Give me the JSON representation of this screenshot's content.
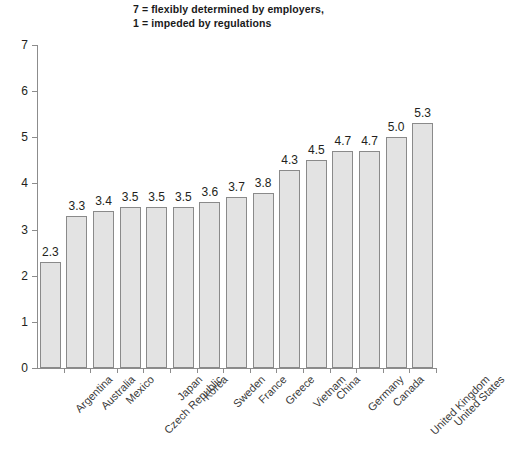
{
  "title": {
    "line1": "7 = flexibly determined by employers,",
    "line2": "1 = impeded by regulations"
  },
  "axis": {
    "y_ticks": [
      "0",
      "1",
      "2",
      "3",
      "4",
      "5",
      "6",
      "7"
    ]
  },
  "colors": {
    "bar_fill": "#e3e3e3",
    "bar_stroke": "#8a8a8a",
    "axis": "#8c8c8c",
    "text": "#231f20",
    "category_text": "#3a3a3a"
  },
  "chart_data": {
    "type": "bar",
    "title": "7 = flexibly determined by employers, 1 = impeded by regulations",
    "xlabel": "",
    "ylabel": "",
    "ylim": [
      0,
      7
    ],
    "yticks": [
      0,
      1,
      2,
      3,
      4,
      5,
      6,
      7
    ],
    "grid": false,
    "legend": "none",
    "data_labels": true,
    "categories": [
      "Argentina",
      "Australia",
      "Mexico",
      "Czech Republic",
      "Japan",
      "Korea",
      "Sweden",
      "France",
      "Greece",
      "Vietnam",
      "China",
      "Germany",
      "Canada",
      "United Kingdom",
      "United States"
    ],
    "values": [
      2.3,
      3.3,
      3.4,
      3.5,
      3.5,
      3.5,
      3.6,
      3.7,
      3.8,
      4.3,
      4.5,
      4.7,
      4.7,
      5.0,
      5.3
    ],
    "value_labels": [
      "2.3",
      "3.3",
      "3.4",
      "3.5",
      "3.5",
      "3.5",
      "3.6",
      "3.7",
      "3.8",
      "4.3",
      "4.5",
      "4.7",
      "4.7",
      "5.0",
      "5.3"
    ]
  }
}
